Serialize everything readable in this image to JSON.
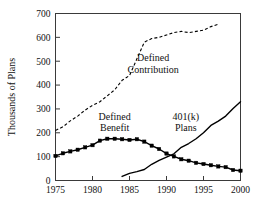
{
  "chart_data": {
    "type": "line",
    "title": "",
    "xlabel": "",
    "ylabel": "Thousands of Plans",
    "xlim": [
      1975,
      2000
    ],
    "ylim": [
      0,
      700
    ],
    "xticks": [
      1975,
      1980,
      1985,
      1990,
      1995,
      2000
    ],
    "yticks": [
      0,
      100,
      200,
      300,
      400,
      500,
      600,
      700
    ],
    "xtick_labels": [
      "1975",
      "1980",
      "1985",
      "1990",
      "1995",
      "2000"
    ],
    "ytick_labels": [
      "0",
      "100",
      "200",
      "300",
      "400",
      "500",
      "600",
      "700"
    ],
    "grid": false,
    "legend_position": "inline-annotations",
    "series": [
      {
        "name": "Defined Contribution",
        "style": "dashed",
        "markers": false,
        "label_lines": [
          "Defined",
          "Contribution"
        ],
        "x": [
          1975,
          1976,
          1977,
          1978,
          1979,
          1980,
          1981,
          1982,
          1983,
          1984,
          1985,
          1986,
          1987,
          1988,
          1989,
          1990,
          1991,
          1992,
          1993,
          1994,
          1995,
          1996,
          1997
        ],
        "values": [
          210,
          225,
          250,
          270,
          295,
          315,
          330,
          355,
          380,
          420,
          440,
          510,
          580,
          595,
          600,
          610,
          620,
          625,
          620,
          625,
          630,
          645,
          655
        ]
      },
      {
        "name": "Defined Benefit",
        "style": "solid",
        "markers": true,
        "label_lines": [
          "Defined",
          "Benefit"
        ],
        "x": [
          1975,
          1976,
          1977,
          1978,
          1979,
          1980,
          1981,
          1982,
          1983,
          1984,
          1985,
          1986,
          1987,
          1988,
          1989,
          1990,
          1991,
          1992,
          1993,
          1994,
          1995,
          1996,
          1997,
          1998,
          1999,
          2000
        ],
        "values": [
          103,
          114,
          122,
          129,
          139,
          148,
          167,
          175,
          175,
          173,
          170,
          173,
          163,
          146,
          132,
          113,
          101,
          89,
          83,
          74,
          69,
          64,
          59,
          56,
          44,
          41
        ]
      },
      {
        "name": "401(k) Plans",
        "style": "solid",
        "markers": false,
        "label_lines": [
          "401(k)",
          "Plans"
        ],
        "x": [
          1984,
          1985,
          1986,
          1987,
          1988,
          1989,
          1990,
          1991,
          1992,
          1993,
          1994,
          1995,
          1996,
          1997,
          1998,
          1999,
          2000
        ],
        "values": [
          17,
          30,
          37,
          46,
          68,
          84,
          98,
          112,
          139,
          155,
          175,
          200,
          231,
          249,
          270,
          302,
          330
        ]
      }
    ],
    "annotations": [
      {
        "name": "defined-contribution-label",
        "lines": [
          "Defined",
          "Contribution"
        ],
        "x": 1988.2,
        "y": 500
      },
      {
        "name": "defined-benefit-label",
        "lines": [
          "Defined",
          "Benefit"
        ],
        "x": 1983.0,
        "y": 255
      },
      {
        "name": "401k-plans-label",
        "lines": [
          "401(k)",
          "Plans"
        ],
        "x": 1992.6,
        "y": 255
      }
    ]
  }
}
